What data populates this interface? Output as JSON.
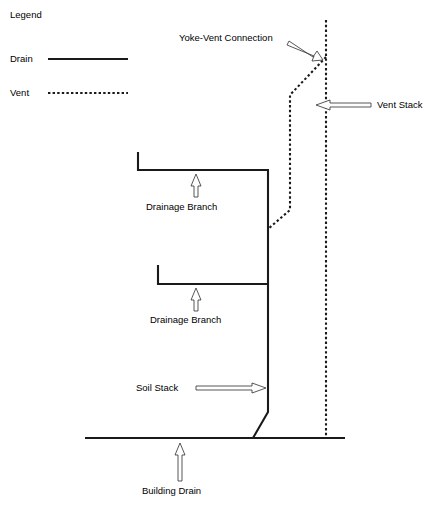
{
  "diagram": {
    "background_color": "#ffffff",
    "line_color": "#1a1a1a",
    "arrow_fill_color": "#fdfdfd",
    "arrow_stroke_color": "#3a3a3a"
  },
  "legend": {
    "title": "Legend",
    "items": [
      {
        "label": "Drain",
        "style": "solid"
      },
      {
        "label": "Vent",
        "style": "dashed"
      }
    ]
  },
  "labels": {
    "yoke_vent_connection": "Yoke-Vent Connection",
    "vent_stack": "Vent Stack",
    "drainage_branch_upper": "Drainage Branch",
    "drainage_branch_lower": "Drainage Branch",
    "soil_stack": "Soil Stack",
    "building_drain": "Building Drain"
  },
  "components": [
    {
      "name": "vent-stack",
      "style": "dashed",
      "orientation": "vertical"
    },
    {
      "name": "yoke-vent-connection",
      "style": "dashed",
      "orientation": "vertical-and-diagonal"
    },
    {
      "name": "soil-stack",
      "style": "solid",
      "orientation": "vertical"
    },
    {
      "name": "drainage-branch-upper",
      "style": "solid",
      "orientation": "horizontal"
    },
    {
      "name": "drainage-branch-lower",
      "style": "solid",
      "orientation": "horizontal"
    },
    {
      "name": "building-drain",
      "style": "solid",
      "orientation": "horizontal"
    }
  ]
}
